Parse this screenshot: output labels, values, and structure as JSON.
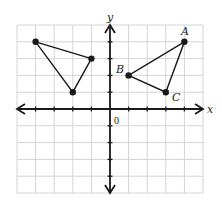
{
  "diagram": {
    "type": "coordinate-plane",
    "axes": {
      "x_label": "x",
      "y_label": "y",
      "origin_label": "0",
      "x_range": [
        -5,
        5
      ],
      "y_range": [
        -5,
        5
      ],
      "tick_spacing": 1,
      "grid": true
    },
    "shapes": [
      {
        "name": "left-triangle",
        "vertices": [
          {
            "label": "",
            "x": -4,
            "y": 4
          },
          {
            "label": "",
            "x": -1,
            "y": 3
          },
          {
            "label": "",
            "x": -2,
            "y": 1
          }
        ]
      },
      {
        "name": "triangle-abc",
        "vertices": [
          {
            "label": "A",
            "x": 4,
            "y": 4
          },
          {
            "label": "B",
            "x": 1,
            "y": 2
          },
          {
            "label": "C",
            "x": 3,
            "y": 1
          }
        ]
      }
    ],
    "colors": {
      "grid": "#d4d4d4",
      "axis": "#1a1a1a",
      "shape": "#1a1a1a",
      "background": "#ffffff"
    }
  }
}
